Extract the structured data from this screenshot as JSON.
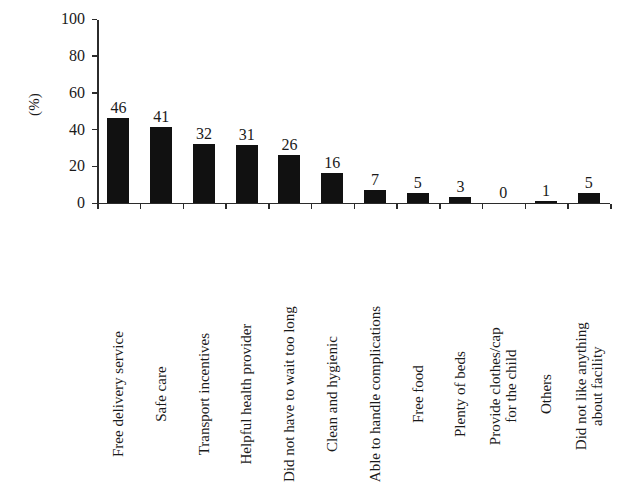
{
  "chart_data": {
    "type": "bar",
    "title": "",
    "xlabel": "",
    "ylabel": "(%)",
    "ylim": [
      0,
      100
    ],
    "yticks": [
      0,
      20,
      40,
      60,
      80,
      100
    ],
    "grid": false,
    "legend": "none",
    "orientation": "vertical",
    "bar_color": "#111111",
    "categories": [
      "Free delivery service",
      "Safe care",
      "Transport incentives",
      "Helpful health provider",
      "Did not have to wait too long",
      "Clean and hygienic",
      "Able to handle complications",
      "Free food",
      "Plenty of beds",
      "Provide clothes/cap for the child",
      "Others",
      "Did not like anything about facility"
    ],
    "category_lines": [
      [
        "Free delivery service"
      ],
      [
        "Safe care"
      ],
      [
        "Transport incentives"
      ],
      [
        "Helpful health provider"
      ],
      [
        "Did not have to wait too long"
      ],
      [
        "Clean and hygienic"
      ],
      [
        "Able to handle complications"
      ],
      [
        "Free food"
      ],
      [
        "Plenty of beds"
      ],
      [
        "Provide clothes/cap",
        "for the child"
      ],
      [
        "Others"
      ],
      [
        "Did not like anything",
        "about facility"
      ]
    ],
    "values": [
      46,
      41,
      32,
      31,
      26,
      16,
      7,
      5,
      3,
      0,
      1,
      5
    ],
    "value_labels": [
      "46",
      "41",
      "32",
      "31",
      "26",
      "16",
      "7",
      "5",
      "3",
      "0",
      "1",
      "5"
    ]
  }
}
